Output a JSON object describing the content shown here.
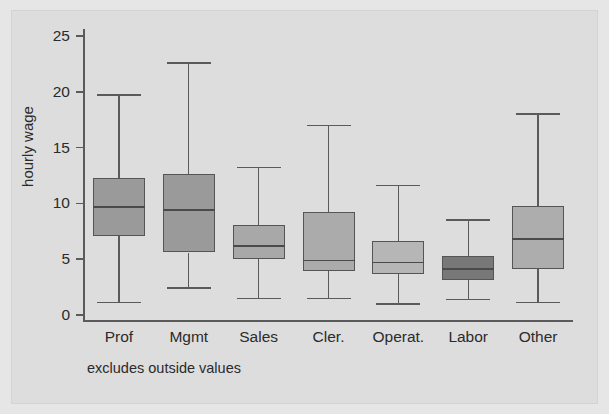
{
  "figure": {
    "background_color": "#dddddd",
    "footnote": "excludes outside values"
  },
  "chart_data": {
    "type": "box",
    "title": "",
    "subtitle": "",
    "xlabel": "",
    "ylabel": "hourly wage",
    "ylim": [
      0,
      26
    ],
    "yticks": [
      0,
      5,
      10,
      15,
      20,
      25
    ],
    "ytick_labels": [
      "0",
      "5",
      "10",
      "15",
      "20",
      "25"
    ],
    "grid": false,
    "legend": "none",
    "annotation": "excludes outside values",
    "categories": [
      "Prof",
      "Mgmt",
      "Sales",
      "Cler.",
      "Operat.",
      "Labor",
      "Other"
    ],
    "boxes": [
      {
        "category": "Prof",
        "whisker_low": 1.1,
        "q1": 7.1,
        "median": 9.7,
        "q3": 12.3,
        "whisker_high": 19.7,
        "fill_color": "#9a9a9a"
      },
      {
        "category": "Mgmt",
        "whisker_low": 2.4,
        "q1": 5.6,
        "median": 9.4,
        "q3": 12.6,
        "whisker_high": 22.6,
        "fill_color": "#9a9a9a"
      },
      {
        "category": "Sales",
        "whisker_low": 1.5,
        "q1": 5.0,
        "median": 6.2,
        "q3": 8.1,
        "whisker_high": 13.2,
        "fill_color": "#a8a8a8"
      },
      {
        "category": "Cler.",
        "whisker_low": 1.5,
        "q1": 3.9,
        "median": 4.9,
        "q3": 9.2,
        "whisker_high": 17.0,
        "fill_color": "#ababab"
      },
      {
        "category": "Operat.",
        "whisker_low": 1.0,
        "q1": 3.7,
        "median": 4.7,
        "q3": 6.6,
        "whisker_high": 11.6,
        "fill_color": "#b6b6b6"
      },
      {
        "category": "Labor",
        "whisker_low": 1.4,
        "q1": 3.1,
        "median": 4.1,
        "q3": 5.3,
        "whisker_high": 8.5,
        "fill_color": "#787878"
      },
      {
        "category": "Other",
        "whisker_low": 1.1,
        "q1": 4.1,
        "median": 6.8,
        "q3": 9.8,
        "whisker_high": 18.0,
        "fill_color": "#adadad"
      }
    ]
  }
}
